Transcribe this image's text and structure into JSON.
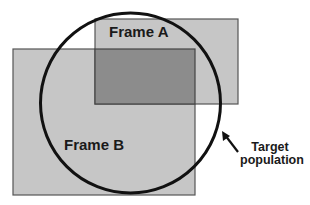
{
  "diagram": {
    "frames": [
      {
        "id": "frame-a",
        "label": "Frame A",
        "x": 95,
        "y": 19,
        "width": 143,
        "height": 85,
        "fill": "#c6c6c6"
      },
      {
        "id": "frame-b",
        "label": "Frame B",
        "x": 13,
        "y": 49,
        "width": 182,
        "height": 146,
        "fill": "#c6c6c6"
      }
    ],
    "overlap": {
      "x": 95,
      "y": 49,
      "width": 100,
      "height": 55,
      "fill": "#8c8c8c"
    },
    "target_population": {
      "label_line1": "Target",
      "label_line2": "population",
      "cx": 130.5,
      "cy": 103,
      "r": 90,
      "stroke": "#111111"
    },
    "arrow": {
      "from": [
        238,
        152
      ],
      "to": [
        222,
        131
      ]
    },
    "colors": {
      "frame_fill": "#c6c6c6",
      "overlap_fill": "#8c8c8c",
      "frame_border": "#555555",
      "circle_stroke": "#111111",
      "text": "#1a1a1a",
      "background": "#ffffff"
    }
  }
}
